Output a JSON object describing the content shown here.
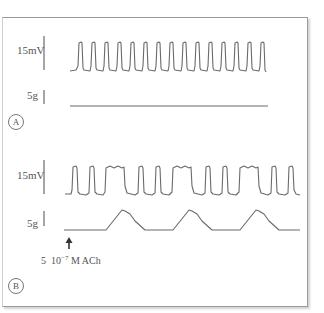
{
  "figure": {
    "panel_a": {
      "label": "A",
      "voltage_scale": "15mV",
      "force_scale": "5g",
      "membrane_trace": {
        "spikes": 15,
        "description": "regular spike train"
      },
      "force_trace": {
        "description": "flat, no contraction"
      }
    },
    "panel_b": {
      "label": "B",
      "voltage_scale": "15mV",
      "force_scale": "5g",
      "annotation": {
        "prefix": "5",
        "base": "10",
        "exponent": "−7",
        "unit": "M ACh",
        "arrow": "up-arrow"
      },
      "membrane_trace": {
        "description": "spike bursts with plateau depolarizations"
      },
      "force_trace": {
        "contractions": 3,
        "description": "three contraction peaks"
      }
    }
  },
  "colors": {
    "trace": "#6a6a6a",
    "frame": "#9a9a9a",
    "text": "#555555"
  }
}
